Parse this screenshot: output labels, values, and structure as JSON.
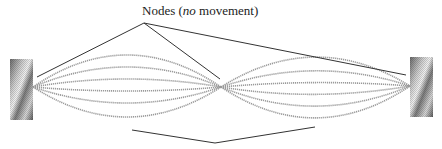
{
  "diagram": {
    "title_label": {
      "prefix": "Nodes (",
      "italic": "no",
      "suffix": " movement)"
    },
    "nodes": [
      {
        "name": "left-node",
        "x": 33,
        "y": 87
      },
      {
        "name": "middle-node",
        "x": 221,
        "y": 87
      },
      {
        "name": "right-node",
        "x": 410,
        "y": 86
      }
    ],
    "walls": [
      {
        "name": "left-wall",
        "x": 10,
        "y": 59,
        "w": 23,
        "h": 61
      },
      {
        "name": "right-wall",
        "x": 410,
        "y": 57,
        "w": 23,
        "h": 60
      }
    ],
    "amplitudes": [
      -32,
      -20,
      -8,
      4,
      16,
      30
    ],
    "colors": {
      "strings": "#9a9a9a",
      "leader_lines": "#333333",
      "wall_dark": "#555555",
      "wall_light": "#e6e6e6"
    }
  }
}
